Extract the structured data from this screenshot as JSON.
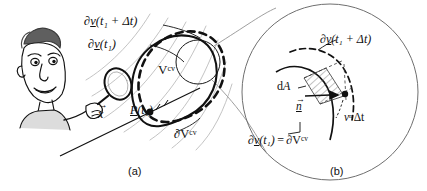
{
  "figure": {
    "type": "scientific-diagram",
    "background_color": "#ffffff",
    "ink_color": "#111111",
    "faint_color": "#9a9a9a"
  },
  "panels": [
    {
      "id": "a",
      "caption": "(a)",
      "labels": {
        "boundary_future": "∂",
        "boundary_future_v": "v",
        "boundary_future_arg": "(t₁ + Δt)",
        "boundary_now": "∂",
        "boundary_now_v": "v",
        "boundary_now_arg": "(t₁)",
        "volume_cv": "V",
        "volume_cv_sup": "cv",
        "surface_cv": "∂V",
        "surface_cv_sup": "cv",
        "position_vector": "x",
        "particle": "P",
        "particle_arg": "(t₁)"
      }
    },
    {
      "id": "b",
      "caption": "(b)",
      "labels": {
        "boundary_future": "∂",
        "boundary_future_v": "v",
        "boundary_future_arg": "(t₁ + Δt)",
        "area_element": "d",
        "area_element_A": "A",
        "normal_vector": "n",
        "swept_height_v": "v",
        "swept_height_sup": "n",
        "swept_height_dt": "Δt",
        "boundary_equality_lhs_d": "∂",
        "boundary_equality_lhs_v": "v",
        "boundary_equality_lhs_arg": "(t₁)",
        "boundary_equality_eq": "=",
        "boundary_equality_rhs": "∂V",
        "boundary_equality_rhs_sup": "cv"
      }
    }
  ],
  "symbols": {
    "partial": "∂",
    "delta": "Δ",
    "equals": "="
  }
}
